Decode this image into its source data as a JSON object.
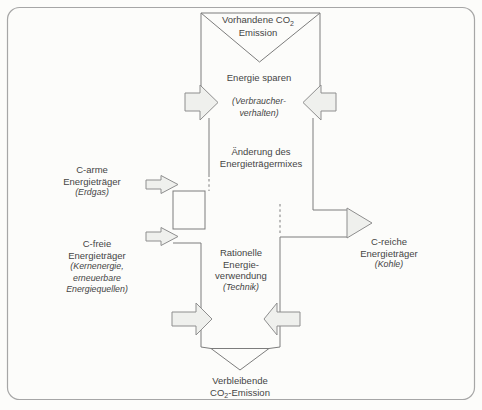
{
  "diagram": {
    "top_funnel": {
      "line1_prefix": "Vorhandene CO",
      "line1_sub": "2",
      "line2": "Emission"
    },
    "stage_energie_sparen": {
      "title": "Energie sparen",
      "note1": "(Verbraucher-",
      "note2": "verhalten)"
    },
    "stage_mix": {
      "line1": "Änderung des",
      "line2": "Energieträgermixes"
    },
    "stage_rationell": {
      "line1": "Rationelle",
      "line2": "Energie-",
      "line3": "verwendung",
      "note": "(Technik)"
    },
    "input_c_arme": {
      "line1": "C-arme",
      "line2": "Energieträger",
      "note": "(Erdgas)"
    },
    "input_c_freie": {
      "line1": "C-freie",
      "line2": "Energieträger",
      "note1": "(Kernenergie,",
      "note2": "erneuerbare",
      "note3": "Energiequellen)"
    },
    "output_c_reiche": {
      "line1": "C-reiche",
      "line2": "Energieträger",
      "note": "(Kohle)"
    },
    "bottom_funnel": {
      "line1": "Verbleibende",
      "line2_prefix": "CO",
      "line2_sub": "2",
      "line2_suffix": "-Emission"
    },
    "colors": {
      "line": "#7c7c7c",
      "arrow_fill": "#eff0ed",
      "arrow_border": "#8e8e8e",
      "text": "#454545",
      "border": "#a6a6a6",
      "background": "#fcfcfa"
    }
  }
}
